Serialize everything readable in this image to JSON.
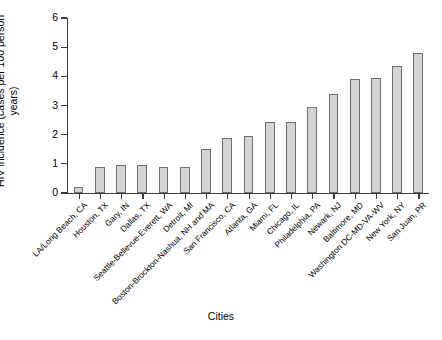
{
  "chart_data": {
    "type": "bar",
    "title": "",
    "xlabel": "Cities",
    "ylabel": "HIV incidence (cases per 100 person\nyears)",
    "ylim": [
      0,
      6
    ],
    "yticks": [
      0,
      1,
      2,
      3,
      4,
      5,
      6
    ],
    "ytick_labels": [
      "0",
      "1",
      "2",
      "3",
      "4",
      "5",
      "6"
    ],
    "grid": false,
    "legend": null,
    "bar_fill_color": "#d4d4d4",
    "bar_edge_color": "#6e6e6e",
    "axis_color": "#3a3a3a",
    "categories": [
      "LA/Long Beach, CA",
      "Houston, TX",
      "Gary, IN",
      "Dallas, TX",
      "Seattle-Bellevue-Everett, WA",
      "Detroit, MI",
      "Boston-Brockton-Nashua, NH and MA",
      "San Francisco, CA",
      "Atlanta, GA",
      "Miami, FL",
      "Chicago, IL",
      "Philadelphia, PA",
      "Newark, NJ",
      "Baltimore, MD",
      "Washington DC-MD-VA-WV",
      "New York, NY",
      "San Juan, PR"
    ],
    "values": [
      0.2,
      0.9,
      0.95,
      0.95,
      0.9,
      0.9,
      1.5,
      1.9,
      1.95,
      2.45,
      2.45,
      2.95,
      3.4,
      3.9,
      3.95,
      4.35,
      4.8
    ]
  },
  "axis": {
    "y_title": "HIV incidence (cases per 100 person\nyears)",
    "x_title": "Cities"
  }
}
